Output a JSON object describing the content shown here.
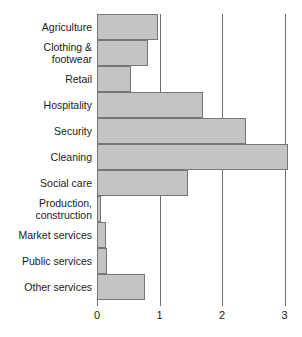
{
  "chart_data": {
    "type": "bar",
    "orientation": "horizontal",
    "title": "",
    "subtitle": "",
    "xlabel": "",
    "ylabel": "",
    "xlim": [
      0,
      3.1
    ],
    "xticks": [
      0,
      1,
      2,
      3
    ],
    "xtick_labels": [
      "0",
      "1",
      "2",
      "3"
    ],
    "grid": "vertical-gridlines-at-xticks",
    "legend": "none",
    "bar_color": "#c4c4c4",
    "bar_border_color": "#757575",
    "gridline_color": "#6e6e6e",
    "categories": [
      "Agriculture",
      "Clothing & footwear",
      "Retail",
      "Hospitality",
      "Security",
      "Cleaning",
      "Social care",
      "Production, construction",
      "Market services",
      "Public services",
      "Other services"
    ],
    "values": [
      0.97,
      0.81,
      0.54,
      1.7,
      2.38,
      3.05,
      1.45,
      0.07,
      0.14,
      0.16,
      0.76
    ]
  },
  "chart": {
    "bars": [
      {
        "label_line1": "Agriculture",
        "label_line2": "",
        "value": 0.97
      },
      {
        "label_line1": "Clothing &",
        "label_line2": "footwear",
        "value": 0.81
      },
      {
        "label_line1": "Retail",
        "label_line2": "",
        "value": 0.54
      },
      {
        "label_line1": "Hospitality",
        "label_line2": "",
        "value": 1.7
      },
      {
        "label_line1": "Security",
        "label_line2": "",
        "value": 2.38
      },
      {
        "label_line1": "Cleaning",
        "label_line2": "",
        "value": 3.05
      },
      {
        "label_line1": "Social care",
        "label_line2": "",
        "value": 1.45
      },
      {
        "label_line1": "Production,",
        "label_line2": "construction",
        "value": 0.07
      },
      {
        "label_line1": "Market services",
        "label_line2": "",
        "value": 0.14
      },
      {
        "label_line1": "Public services",
        "label_line2": "",
        "value": 0.16
      },
      {
        "label_line1": "Other services",
        "label_line2": "",
        "value": 0.76
      }
    ],
    "axis": {
      "ticks": [
        {
          "label": "0",
          "value": 0
        },
        {
          "label": "1",
          "value": 1
        },
        {
          "label": "2",
          "value": 2
        },
        {
          "label": "3",
          "value": 3
        }
      ]
    }
  }
}
